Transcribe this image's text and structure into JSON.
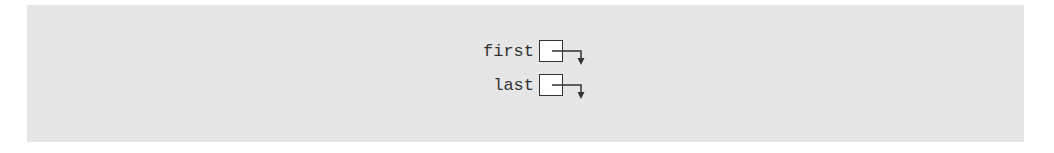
{
  "diagram": {
    "type": "linked-list-pointers",
    "background_color": "#e6e6e6",
    "stroke_color": "#333333",
    "pointers": [
      {
        "name": "first",
        "label": "first",
        "points_to": "null/down-arrow"
      },
      {
        "name": "last",
        "label": "last",
        "points_to": "null/down-arrow"
      }
    ]
  }
}
